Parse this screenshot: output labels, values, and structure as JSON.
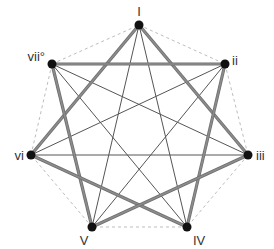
{
  "diagram": {
    "colors": {
      "thick_edge": "#8c8c8c",
      "thick_edge_outline": "#6e6e6e",
      "thin_edge": "#555555",
      "dashed_edge": "#bdbdbd",
      "node": "#111111",
      "label": "#333333"
    },
    "nodes": [
      {
        "id": "I",
        "label": "I",
        "x": 139,
        "y": 25,
        "lx": 139,
        "ly": 16,
        "anchor": "middle"
      },
      {
        "id": "ii",
        "label": "ii",
        "x": 225,
        "y": 64,
        "lx": 232,
        "ly": 65,
        "anchor": "start"
      },
      {
        "id": "iii",
        "label": "iii",
        "x": 248,
        "y": 155,
        "lx": 256,
        "ly": 160,
        "anchor": "start"
      },
      {
        "id": "IV",
        "label": "IV",
        "x": 187,
        "y": 227,
        "lx": 193,
        "ly": 245,
        "anchor": "start"
      },
      {
        "id": "V",
        "label": "V",
        "x": 92,
        "y": 227,
        "lx": 84,
        "ly": 245,
        "anchor": "middle"
      },
      {
        "id": "vi",
        "label": "vi",
        "x": 31,
        "y": 155,
        "lx": 24,
        "ly": 160,
        "anchor": "end"
      },
      {
        "id": "vii",
        "label": "vii°",
        "x": 52,
        "y": 64,
        "lx": 45,
        "ly": 61,
        "anchor": "end"
      }
    ],
    "edges_dashed": [
      [
        "I",
        "ii"
      ],
      [
        "ii",
        "iii"
      ],
      [
        "iii",
        "IV"
      ],
      [
        "IV",
        "V"
      ],
      [
        "V",
        "vi"
      ],
      [
        "vi",
        "vii"
      ],
      [
        "vii",
        "I"
      ]
    ],
    "edges_thick": [
      [
        "I",
        "vi"
      ],
      [
        "I",
        "iii"
      ],
      [
        "vii",
        "ii"
      ],
      [
        "vii",
        "V"
      ],
      [
        "ii",
        "IV"
      ],
      [
        "vi",
        "IV"
      ],
      [
        "iii",
        "V"
      ]
    ],
    "edges_thin": [
      [
        "I",
        "V"
      ],
      [
        "I",
        "IV"
      ],
      [
        "vii",
        "iii"
      ],
      [
        "vii",
        "IV"
      ],
      [
        "ii",
        "vi"
      ],
      [
        "ii",
        "V"
      ],
      [
        "vi",
        "iii"
      ]
    ]
  }
}
